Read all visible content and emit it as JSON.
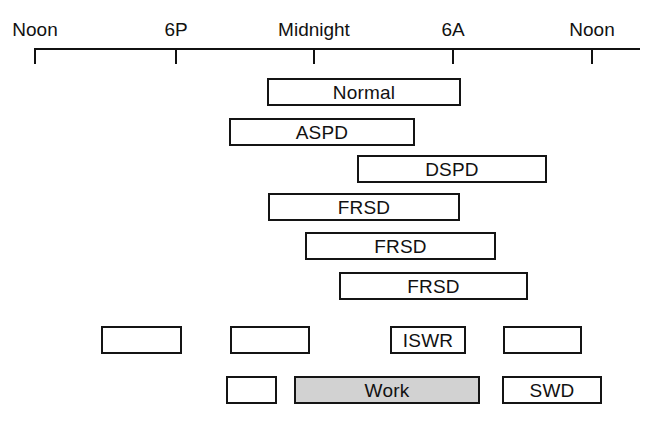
{
  "figure": {
    "title": "",
    "background_color": "#ffffff",
    "line_color": "#141414",
    "shaded_fill_color": "#d2d2d2",
    "empty_fill_color": "#ffffff"
  },
  "axis": {
    "labels": [
      "Noon",
      "6P",
      "Midnight",
      "6A",
      "Noon"
    ],
    "tick_hours": [
      0,
      6,
      12,
      18,
      24
    ],
    "start_label": "Noon",
    "end_label": "Noon"
  },
  "chart_data": {
    "type": "bar",
    "orientation": "horizontal",
    "xlabel": "Clock time",
    "ylabel": "",
    "xlim": [
      12,
      36
    ],
    "grid": false,
    "legend": "none",
    "axis_ticks": [
      {
        "label": "Noon",
        "hour": 12,
        "x": 34
      },
      {
        "label": "6P",
        "hour": 18,
        "x": 175
      },
      {
        "label": "Midnight",
        "hour": 24,
        "x": 313
      },
      {
        "label": "6A",
        "hour": 30,
        "x": 452
      },
      {
        "label": "Noon",
        "hour": 36,
        "x": 591
      }
    ],
    "rows": [
      {
        "name": "normal",
        "y": 78,
        "segments": [
          {
            "label": "Normal",
            "x": 267,
            "width": 194,
            "start_hour": 22.0,
            "end_hour": 30.4,
            "shaded": false
          }
        ]
      },
      {
        "name": "aspd",
        "y": 118,
        "segments": [
          {
            "label": "ASPD",
            "x": 229,
            "width": 186,
            "start_hour": 20.4,
            "end_hour": 28.4,
            "shaded": false
          }
        ]
      },
      {
        "name": "dspd",
        "y": 155,
        "segments": [
          {
            "label": "DSPD",
            "x": 357,
            "width": 190,
            "start_hour": 25.9,
            "end_hour": 34.1,
            "shaded": false
          }
        ]
      },
      {
        "name": "frsd-1",
        "y": 193,
        "segments": [
          {
            "label": "FRSD",
            "x": 268,
            "width": 192,
            "start_hour": 22.1,
            "end_hour": 30.4,
            "shaded": false
          }
        ]
      },
      {
        "name": "frsd-2",
        "y": 232,
        "segments": [
          {
            "label": "FRSD",
            "x": 305,
            "width": 191,
            "start_hour": 23.7,
            "end_hour": 31.9,
            "shaded": false
          }
        ]
      },
      {
        "name": "frsd-3",
        "y": 272,
        "segments": [
          {
            "label": "FRSD",
            "x": 339,
            "width": 189,
            "start_hour": 25.2,
            "end_hour": 33.3,
            "shaded": false
          }
        ]
      },
      {
        "name": "iswr",
        "y": 326,
        "segments": [
          {
            "label": "",
            "x": 101,
            "width": 81,
            "start_hour": 14.9,
            "end_hour": 18.4,
            "shaded": false
          },
          {
            "label": "",
            "x": 230,
            "width": 80,
            "start_hour": 20.5,
            "end_hour": 23.9,
            "shaded": false
          },
          {
            "label": "ISWR",
            "x": 390,
            "width": 76,
            "start_hour": 27.4,
            "end_hour": 30.6,
            "shaded": false
          },
          {
            "label": "",
            "x": 503,
            "width": 79,
            "start_hour": 32.2,
            "end_hour": 35.6,
            "shaded": false
          }
        ]
      },
      {
        "name": "swd",
        "y": 376,
        "segments": [
          {
            "label": "",
            "x": 226,
            "width": 51,
            "start_hour": 20.3,
            "end_hour": 22.5,
            "shaded": false
          },
          {
            "label": "Work",
            "x": 294,
            "width": 186,
            "start_hour": 23.2,
            "end_hour": 31.2,
            "shaded": true
          },
          {
            "label": "SWD",
            "x": 502,
            "width": 100,
            "start_hour": 32.2,
            "end_hour": 36.5,
            "shaded": false
          }
        ]
      }
    ]
  }
}
